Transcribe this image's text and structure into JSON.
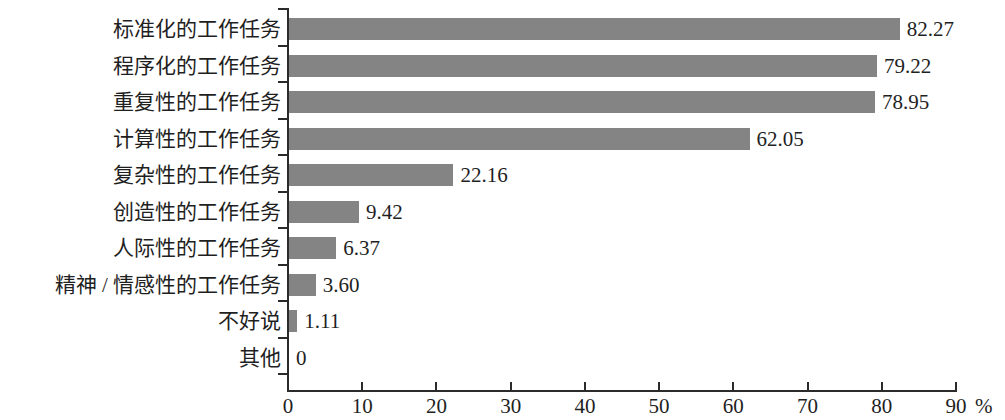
{
  "chart_data": {
    "type": "bar",
    "orientation": "horizontal",
    "title": "",
    "subtitle": "",
    "xlabel": "%",
    "ylabel": "",
    "xlim": [
      0,
      90
    ],
    "xticks": [
      0,
      10,
      20,
      30,
      40,
      50,
      60,
      70,
      80,
      90
    ],
    "xtick_labels": [
      "0",
      "10",
      "20",
      "30",
      "40",
      "50",
      "60",
      "70",
      "80",
      "90"
    ],
    "grid": false,
    "legend": null,
    "bar_color": "#848484",
    "axis_color": "#2b2b2b",
    "categories": [
      "标准化的工作任务",
      "程序化的工作任务",
      "重复性的工作任务",
      "计算性的工作任务",
      "复杂性的工作任务",
      "创造性的工作任务",
      "人际性的工作任务",
      "精神 / 情感性的工作任务",
      "不好说",
      "其他"
    ],
    "values": [
      82.27,
      79.22,
      78.95,
      62.05,
      22.16,
      9.42,
      6.37,
      3.6,
      1.11,
      0
    ],
    "value_labels": [
      "82.27",
      "79.22",
      "78.95",
      "62.05",
      "22.16",
      "9.42",
      "6.37",
      "3.60",
      "1.11",
      "0"
    ]
  },
  "axis": {
    "unit": "%"
  }
}
